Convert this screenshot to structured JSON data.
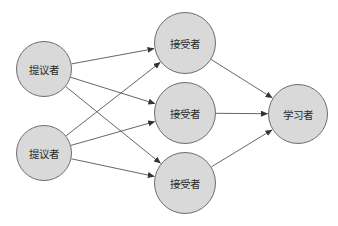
{
  "diagram": {
    "type": "paxos-roles",
    "colors": {
      "node_fill": "#d9d9d9",
      "node_stroke": "#6e6e6e",
      "edge": "#555555",
      "text": "#2a2a2a"
    },
    "nodes": [
      {
        "id": "p1",
        "label": "提议者",
        "role": "proposer",
        "cx": 44,
        "cy": 69,
        "r": 28
      },
      {
        "id": "p2",
        "label": "提议者",
        "role": "proposer",
        "cx": 44,
        "cy": 153,
        "r": 28
      },
      {
        "id": "a1",
        "label": "接受者",
        "role": "acceptor",
        "cx": 185,
        "cy": 43,
        "r": 31
      },
      {
        "id": "a2",
        "label": "接受者",
        "role": "acceptor",
        "cx": 185,
        "cy": 113,
        "r": 31
      },
      {
        "id": "a3",
        "label": "接受者",
        "role": "acceptor",
        "cx": 185,
        "cy": 183,
        "r": 31
      },
      {
        "id": "l1",
        "label": "学习者",
        "role": "learner",
        "cx": 298,
        "cy": 114,
        "r": 30
      }
    ],
    "edges": [
      {
        "from": "p1",
        "to": "a1"
      },
      {
        "from": "p1",
        "to": "a2"
      },
      {
        "from": "p1",
        "to": "a3"
      },
      {
        "from": "p2",
        "to": "a1"
      },
      {
        "from": "p2",
        "to": "a2"
      },
      {
        "from": "p2",
        "to": "a3"
      },
      {
        "from": "a1",
        "to": "l1"
      },
      {
        "from": "a2",
        "to": "l1"
      },
      {
        "from": "a3",
        "to": "l1"
      }
    ]
  }
}
